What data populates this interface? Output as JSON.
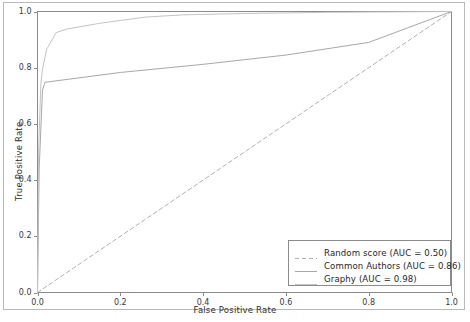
{
  "chart_data": {
    "type": "line",
    "title": "",
    "xlabel": "False Positive Rate",
    "ylabel": "True Positive Rate",
    "xlim": [
      0.0,
      1.0
    ],
    "ylim": [
      0.0,
      1.0
    ],
    "xticks": [
      "0.0",
      "0.2",
      "0.4",
      "0.6",
      "0.8",
      "1.0"
    ],
    "yticks": [
      "0.0",
      "0.2",
      "0.4",
      "0.6",
      "0.8",
      "1.0"
    ],
    "xtick_values": [
      0.0,
      0.2,
      0.4,
      0.6,
      0.8,
      1.0
    ],
    "ytick_values": [
      0.0,
      0.2,
      0.4,
      0.6,
      0.8,
      1.0
    ],
    "grid": false,
    "legend_position": "lower right",
    "series": [
      {
        "name": "Random score (AUC = 0.50)",
        "label": "Random score (AUC = 0.50)",
        "auc": 0.5,
        "style": "dashed",
        "color": "#b0b0bd",
        "x": [
          0.0,
          1.0
        ],
        "y": [
          0.0,
          1.0
        ]
      },
      {
        "name": "Common Authors (AUC = 0.86)",
        "label": "Common Authors (AUC = 0.86)",
        "auc": 0.86,
        "style": "solid",
        "color": "#a8a8a8",
        "x": [
          0.0,
          0.004,
          0.012,
          0.018,
          0.2,
          0.4,
          0.6,
          0.8,
          1.0
        ],
        "y": [
          0.0,
          0.44,
          0.72,
          0.748,
          0.783,
          0.812,
          0.845,
          0.89,
          1.0
        ]
      },
      {
        "name": "Graphy (AUC = 0.98)",
        "label": "Graphy (AUC = 0.98)",
        "auc": 0.98,
        "style": "solid",
        "color": "#c4c4c4",
        "x": [
          0.0,
          0.003,
          0.008,
          0.012,
          0.022,
          0.045,
          0.072,
          0.1,
          0.15,
          0.2,
          0.26,
          0.35,
          0.5,
          0.7,
          1.0
        ],
        "y": [
          0.0,
          0.52,
          0.74,
          0.795,
          0.865,
          0.925,
          0.938,
          0.945,
          0.958,
          0.968,
          0.98,
          0.988,
          0.993,
          0.997,
          1.0
        ]
      }
    ]
  },
  "axes": {
    "frame_color": "#8a8a8a"
  }
}
